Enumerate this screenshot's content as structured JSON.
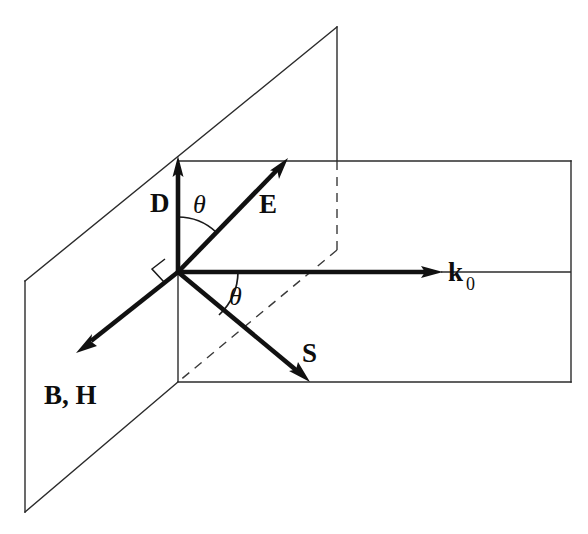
{
  "figure": {
    "kind": "vector-diagram",
    "title": "",
    "background_color": "#ffffff",
    "line_color": "#2b2b2b",
    "vector_color": "#111111",
    "label_color": "#0d0d0d",
    "planes": [
      {
        "name": "vertical-plane",
        "style": "solid-outline",
        "corners": "25,281 337,27 337,258 178,382 25,512"
      },
      {
        "name": "horizontal-plane",
        "style": "solid-outline",
        "corners": "178,161 571,161 571,382 178,382"
      }
    ],
    "dashed_lines": [
      {
        "name": "vertical-projection-dash",
        "from": "337,161",
        "to": "337,250"
      },
      {
        "name": "diagonal-projection-dash",
        "from": "337,250",
        "to": "178,382"
      }
    ],
    "vectors": [
      {
        "name": "D",
        "label": "D",
        "from": "178,272",
        "to": "178,160",
        "label_x": 152,
        "label_y": 208
      },
      {
        "name": "E",
        "label": "E",
        "from": "178,272",
        "to": "286,160",
        "label_x": 261,
        "label_y": 211
      },
      {
        "name": "k0",
        "label": "k",
        "subscript": "0",
        "from": "178,272",
        "to": "441,272",
        "label_x": 450,
        "label_y": 280
      },
      {
        "name": "S",
        "label": "S",
        "from": "178,272",
        "to": "308,381",
        "label_x": 303,
        "label_y": 361
      },
      {
        "name": "BH",
        "label": "B, H",
        "from": "178,272",
        "to": "79,350",
        "label_x": 46,
        "label_y": 403
      }
    ],
    "angles": [
      {
        "name": "theta-upper",
        "label": "θ",
        "label_x": 194,
        "label_y": 211,
        "between": [
          "D",
          "E"
        ]
      },
      {
        "name": "theta-lower",
        "label": "θ",
        "label_x": 232,
        "label_y": 302,
        "between": [
          "k0",
          "S"
        ]
      }
    ],
    "right_angle": {
      "name": "right-angle-marker",
      "at": "178,272",
      "between": [
        "D",
        "BH"
      ]
    },
    "extension_line": {
      "name": "k0-axis-extension",
      "from": "441,272",
      "to": "571,272"
    }
  },
  "labels": {
    "D": "D",
    "E": "E",
    "k": "k",
    "k_sub": "0",
    "S": "S",
    "BH": "B, H",
    "theta_upper": "θ",
    "theta_lower": "θ"
  }
}
